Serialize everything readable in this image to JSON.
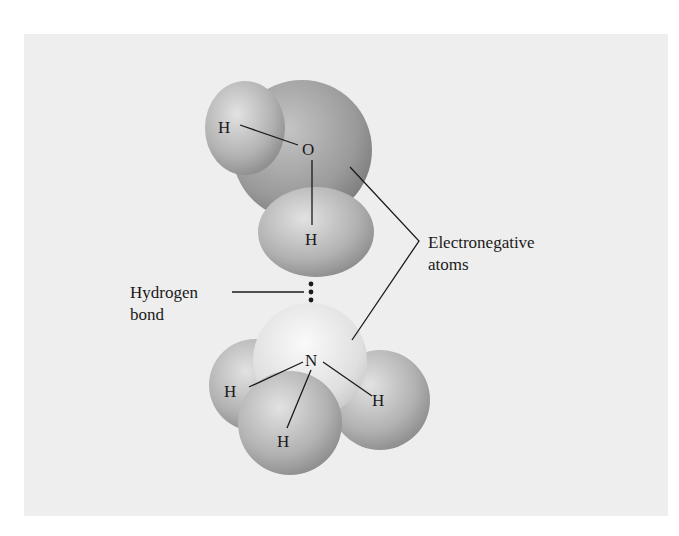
{
  "diagram": {
    "water_molecule": {
      "atoms": [
        {
          "symbol": "O",
          "label": "O"
        },
        {
          "symbol": "H",
          "label": "H"
        },
        {
          "symbol": "H",
          "label": "H"
        }
      ]
    },
    "ammonia_molecule": {
      "atoms": [
        {
          "symbol": "N",
          "label": "N"
        },
        {
          "symbol": "H",
          "label": "H"
        },
        {
          "symbol": "H",
          "label": "H"
        },
        {
          "symbol": "H",
          "label": "H"
        }
      ]
    },
    "callouts": {
      "electronegative": {
        "line1": "Electronegative",
        "line2": "atoms"
      },
      "hydrogen_bond": {
        "line1": "Hydrogen",
        "line2": "bond"
      }
    },
    "colors": {
      "background_panel": "#eeeeee",
      "atom_dark": "#8f8f8f",
      "atom_light": "#e6e6e6",
      "line": "#1a1a1a"
    }
  }
}
